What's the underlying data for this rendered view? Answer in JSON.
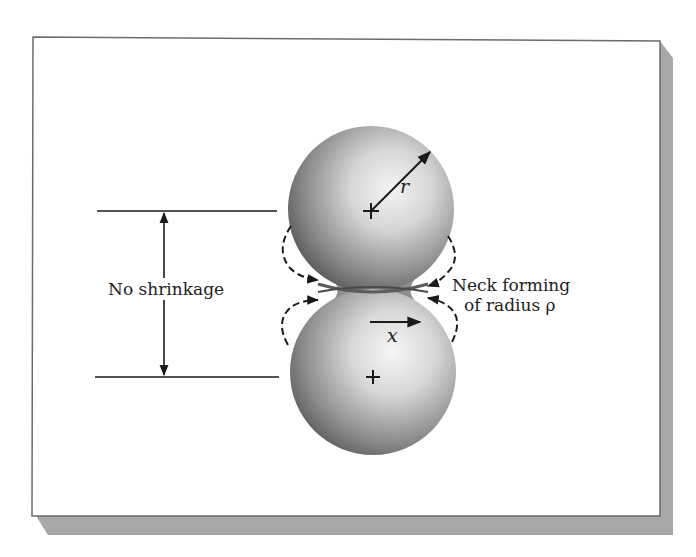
{
  "figure": {
    "type": "sintering-two-sphere-model",
    "frame": {
      "background": "#ffffff",
      "border_color": "#6b6b6b",
      "shadow_color": "#a8a8a8"
    },
    "spheres": [
      {
        "id": "upper",
        "center_symbol": "+",
        "radius_label": "r"
      },
      {
        "id": "lower",
        "center_symbol": "+",
        "displacement_label": "x"
      }
    ],
    "labels": {
      "no_shrinkage": "No shrinkage",
      "neck_line1": "Neck forming",
      "neck_line2": "of radius ρ",
      "radius": "r",
      "neck_x": "x"
    },
    "colors": {
      "line": "#1a1a1a",
      "sphere_light": "#f2f2f2",
      "sphere_dark": "#5a5a5a"
    }
  }
}
